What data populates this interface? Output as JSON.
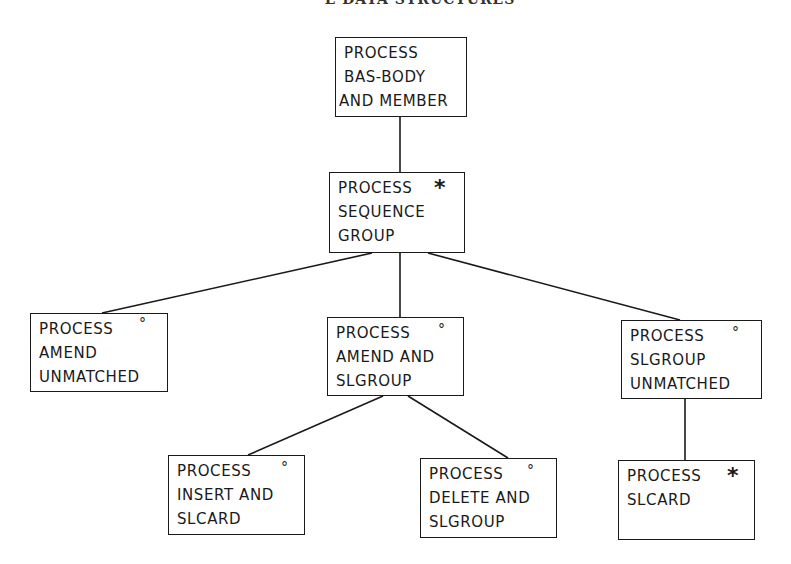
{
  "header": {
    "text": "E DATA STRUCTURES"
  },
  "diagram": {
    "type": "structure-chart",
    "nodes": [
      {
        "id": "n1",
        "lines": [
          "PROCESS",
          "BAS-BODY",
          "AND MEMBER"
        ],
        "marker": "",
        "box": {
          "x": 335,
          "y": 37,
          "w": 132,
          "h": 80
        }
      },
      {
        "id": "n2",
        "lines": [
          "PROCESS",
          "SEQUENCE",
          "GROUP"
        ],
        "marker": "*",
        "box": {
          "x": 329,
          "y": 172,
          "w": 136,
          "h": 81
        }
      },
      {
        "id": "n3",
        "lines": [
          "PROCESS",
          "AMEND",
          "UNMATCHED"
        ],
        "marker": "°",
        "box": {
          "x": 30,
          "y": 313,
          "w": 138,
          "h": 79
        }
      },
      {
        "id": "n4",
        "lines": [
          "PROCESS",
          "AMEND AND",
          "SLGROUP"
        ],
        "marker": "°",
        "box": {
          "x": 327,
          "y": 317,
          "w": 137,
          "h": 79
        }
      },
      {
        "id": "n5",
        "lines": [
          "PROCESS",
          "SLGROUP",
          "UNMATCHED"
        ],
        "marker": "°",
        "box": {
          "x": 621,
          "y": 320,
          "w": 141,
          "h": 79
        }
      },
      {
        "id": "n6",
        "lines": [
          "PROCESS",
          "INSERT AND",
          "SLCARD"
        ],
        "marker": "°",
        "box": {
          "x": 168,
          "y": 455,
          "w": 137,
          "h": 80
        }
      },
      {
        "id": "n7",
        "lines": [
          "PROCESS",
          "DELETE AND",
          "SLGROUP"
        ],
        "marker": "°",
        "box": {
          "x": 420,
          "y": 458,
          "w": 137,
          "h": 80
        }
      },
      {
        "id": "n8",
        "lines": [
          "PROCESS",
          "SLCARD"
        ],
        "marker": "*",
        "box": {
          "x": 618,
          "y": 460,
          "w": 137,
          "h": 80
        }
      }
    ],
    "edges": [
      {
        "from": "n1",
        "to": "n2"
      },
      {
        "from": "n2",
        "to": "n3"
      },
      {
        "from": "n2",
        "to": "n4"
      },
      {
        "from": "n2",
        "to": "n5"
      },
      {
        "from": "n4",
        "to": "n6"
      },
      {
        "from": "n4",
        "to": "n7"
      },
      {
        "from": "n5",
        "to": "n8"
      }
    ],
    "legend_markers": {
      "iteration": "*",
      "selection": "°"
    }
  }
}
